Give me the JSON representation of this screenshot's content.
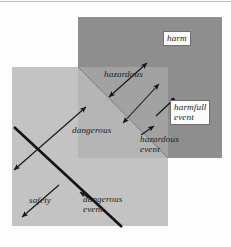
{
  "figure": {
    "type": "venn-style overlapping region diagram"
  },
  "canvas": {
    "width": 231,
    "height": 247,
    "background": "#fdfdfd"
  },
  "regions": [
    {
      "id": "harm-square",
      "name": "harm region",
      "fill": "#8e8e8e",
      "x": 78,
      "y": 17,
      "w": 144,
      "h": 141
    },
    {
      "id": "safety-square",
      "name": "safety / danger region",
      "fill": "#c3c3c3",
      "x": 12,
      "y": 67,
      "w": 156,
      "h": 159
    },
    {
      "id": "overlap-region",
      "name": "hazard overlap region",
      "fill": "#a9a9a9"
    },
    {
      "id": "overlap-lighter-wedge",
      "name": "dangerous wedge inside overlap",
      "fill": "#b8b8b8"
    }
  ],
  "labels": {
    "harm": "harm",
    "harmfull_event": "harmfull\nevent",
    "hazardous": "hazardous",
    "hazardous_event": "hazardous\nevent",
    "dangerous": "dangerous",
    "dangerous_event": "dangerous\nevent",
    "safety": "safety"
  },
  "annotations": [
    {
      "name": "harm-label",
      "boxed": true,
      "x": 163,
      "y": 32
    },
    {
      "name": "harmfull-event-label",
      "boxed": true,
      "x": 170,
      "y": 101
    },
    {
      "name": "hazardous-label",
      "boxed": false,
      "x": 104,
      "y": 70
    },
    {
      "name": "hazardous-event-label",
      "boxed": false,
      "x": 141,
      "y": 137
    },
    {
      "name": "dangerous-label",
      "boxed": false,
      "x": 73,
      "y": 126
    },
    {
      "name": "dangerous-event-label",
      "boxed": false,
      "x": 84,
      "y": 196
    },
    {
      "name": "safety-label",
      "boxed": false,
      "x": 30,
      "y": 196
    }
  ],
  "arrows": [
    {
      "name": "hazardous-arrow-upper",
      "style": "double-headed",
      "x1": 108,
      "y1": 97,
      "x2": 148,
      "y2": 64
    },
    {
      "name": "hazardous-arrow-lower",
      "style": "double-headed",
      "x1": 122,
      "y1": 122,
      "x2": 158,
      "y2": 85
    },
    {
      "name": "dangerous-arrow",
      "style": "double-headed",
      "x1": 13,
      "y1": 168,
      "x2": 85,
      "y2": 108
    },
    {
      "name": "harmfull-event-pointer",
      "style": "dot-tipped",
      "x1": 157,
      "y1": 115,
      "x2": 174,
      "y2": 100
    },
    {
      "name": "hazardous-event-pointer",
      "style": "single-headed",
      "x1": 152,
      "y1": 128,
      "x2": 141,
      "y2": 136
    },
    {
      "name": "safety-arrow",
      "style": "single-headed",
      "x1": 58,
      "y1": 186,
      "x2": 21,
      "y2": 216
    },
    {
      "name": "dangerous-event-tick",
      "style": "single-headed",
      "x1": 94,
      "y1": 201,
      "x2": 79,
      "y2": 192
    }
  ],
  "lines": [
    {
      "name": "danger-boundary-line",
      "weight": "thick",
      "color": "#111111",
      "x1": 14,
      "y1": 127,
      "x2": 121,
      "y2": 226
    },
    {
      "name": "hazard-boundary-line",
      "weight": "thin",
      "color": "#7a7a7a",
      "x1": 78,
      "y1": 67,
      "x2": 168,
      "y2": 158
    }
  ],
  "colors": {
    "harm_fill": "#8e8e8e",
    "safety_fill": "#c3c3c3",
    "overlap_fill": "#a2a2a2",
    "wedge_fill": "#b5b5b5",
    "line_dark": "#111111",
    "label_text": "#1b1b1b",
    "label_box_bg": "#fbfbfb",
    "label_box_border": "#6f6f6f",
    "page_bg": "#fdfdfd"
  }
}
